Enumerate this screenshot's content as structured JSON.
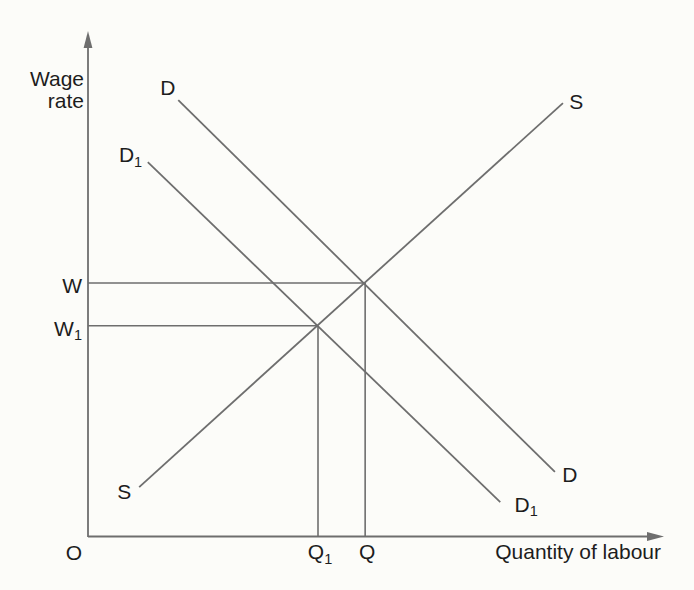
{
  "figure": {
    "bg_color": "#fcfcf9",
    "line_color": "#6e6e6e",
    "text_color": "#1d1d1d"
  },
  "chart_data": {
    "type": "line",
    "title": "",
    "xlabel": "Quantity of labour",
    "ylabel": "Wage rate",
    "origin_label": "O",
    "x_range": [
      0,
      100
    ],
    "y_range": [
      0,
      100
    ],
    "grid": false,
    "legend": "none",
    "series": [
      {
        "name": "D",
        "role": "labour-demand",
        "points": [
          [
            15.7,
            86.7
          ],
          [
            81.2,
            12.9
          ]
        ],
        "start_label": {
          "text": "D",
          "sub": "",
          "x": 13.9,
          "y": 87.7
        },
        "end_label": {
          "text": "D",
          "sub": "",
          "x": 83.8,
          "y": 10.9
        }
      },
      {
        "name": "D1",
        "role": "labour-demand-shifted",
        "points": [
          [
            10.4,
            74.4
          ],
          [
            71.7,
            6.9
          ]
        ],
        "start_label": {
          "text": "D",
          "sub": "1",
          "x": 7.4,
          "y": 74.4
        },
        "end_label": {
          "text": "D",
          "sub": "1",
          "x": 76.2,
          "y": 5.0
        }
      },
      {
        "name": "S",
        "role": "labour-supply",
        "points": [
          [
            8.9,
            9.9
          ],
          [
            82.6,
            86.1
          ]
        ],
        "start_label": {
          "text": "S",
          "sub": "",
          "x": 6.3,
          "y": 7.5
        },
        "end_label": {
          "text": "S",
          "sub": "",
          "x": 84.9,
          "y": 84.9
        }
      }
    ],
    "equilibria": [
      {
        "x": 48.2,
        "y": 50.4,
        "wage_label": {
          "text": "W",
          "sub": ""
        },
        "quantity_label": {
          "text": "Q",
          "sub": ""
        }
      },
      {
        "x": 40.0,
        "y": 41.9,
        "wage_label": {
          "text": "W",
          "sub": "1"
        },
        "quantity_label": {
          "text": "Q",
          "sub": "1"
        }
      }
    ]
  }
}
